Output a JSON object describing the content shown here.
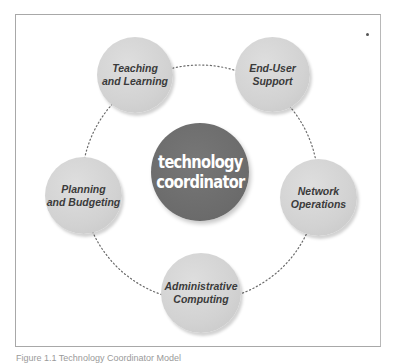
{
  "diagram": {
    "center": {
      "label": "technology\ncoordinator",
      "color": "#6b6b6b"
    },
    "nodes": [
      {
        "id": "teaching",
        "label": "Teaching\nand Learning"
      },
      {
        "id": "end-user",
        "label": "End-User\nSupport"
      },
      {
        "id": "network",
        "label": "Network\nOperations"
      },
      {
        "id": "administrative",
        "label": "Administrative\nComputing"
      },
      {
        "id": "planning",
        "label": "Planning\nand Budgeting"
      }
    ],
    "node_color": "#d2d2d2",
    "text_color": "#3b3b3b"
  },
  "caption": "Figure 1.1 Technology Coordinator Model"
}
